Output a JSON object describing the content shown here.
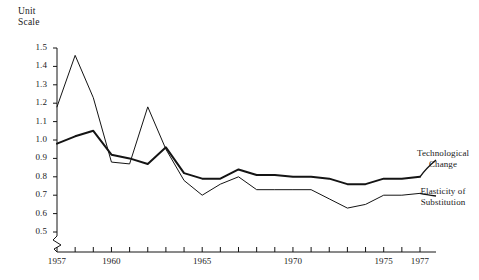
{
  "chart_data": {
    "type": "line",
    "title": "",
    "ylabel": "Unit\nScale",
    "xlabel": "",
    "ylim": [
      0.5,
      1.5
    ],
    "ytick_labels": [
      "1.5",
      "1.4",
      "1.3",
      "1.2",
      "1.1",
      "1.0",
      "0.9",
      "0.8",
      "0.7",
      "0.6",
      "0.5"
    ],
    "ytick_values": [
      1.5,
      1.4,
      1.3,
      1.2,
      1.1,
      1.0,
      0.9,
      0.8,
      0.7,
      0.6,
      0.5
    ],
    "axis_break": true,
    "xlim": [
      1957,
      1977
    ],
    "x": [
      1957,
      1958,
      1959,
      1960,
      1961,
      1962,
      1963,
      1964,
      1965,
      1966,
      1967,
      1968,
      1969,
      1970,
      1971,
      1972,
      1973,
      1974,
      1975,
      1976,
      1977
    ],
    "xtick_labels": [
      "1957",
      "1960",
      "1965",
      "1970",
      "1975",
      "1977"
    ],
    "xtick_values": [
      1957,
      1960,
      1965,
      1970,
      1975,
      1977
    ],
    "grid": false,
    "legend_position": "right-inline",
    "series": [
      {
        "name": "Technological Change",
        "label": "Technological\nChange",
        "line_width": 2.0,
        "color": "#141414",
        "values": [
          0.98,
          1.02,
          1.05,
          0.92,
          0.9,
          0.87,
          0.96,
          0.82,
          0.79,
          0.79,
          0.84,
          0.81,
          0.81,
          0.8,
          0.8,
          0.79,
          0.76,
          0.76,
          0.79,
          0.79,
          0.8
        ]
      },
      {
        "name": "Elasticity of Substitution",
        "label": "Elasticity of\nSubstitution",
        "line_width": 1.0,
        "color": "#141414",
        "values": [
          1.18,
          1.46,
          1.23,
          0.88,
          0.87,
          1.18,
          0.95,
          0.78,
          0.7,
          0.76,
          0.8,
          0.73,
          0.73,
          0.73,
          0.73,
          0.68,
          0.63,
          0.65,
          0.7,
          0.7,
          0.71
        ]
      }
    ]
  },
  "axis": {
    "x_origin_px": 57,
    "x_end_px": 420,
    "y_top_px": 48,
    "y_bottom_px": 232,
    "baseline_px": 252
  }
}
